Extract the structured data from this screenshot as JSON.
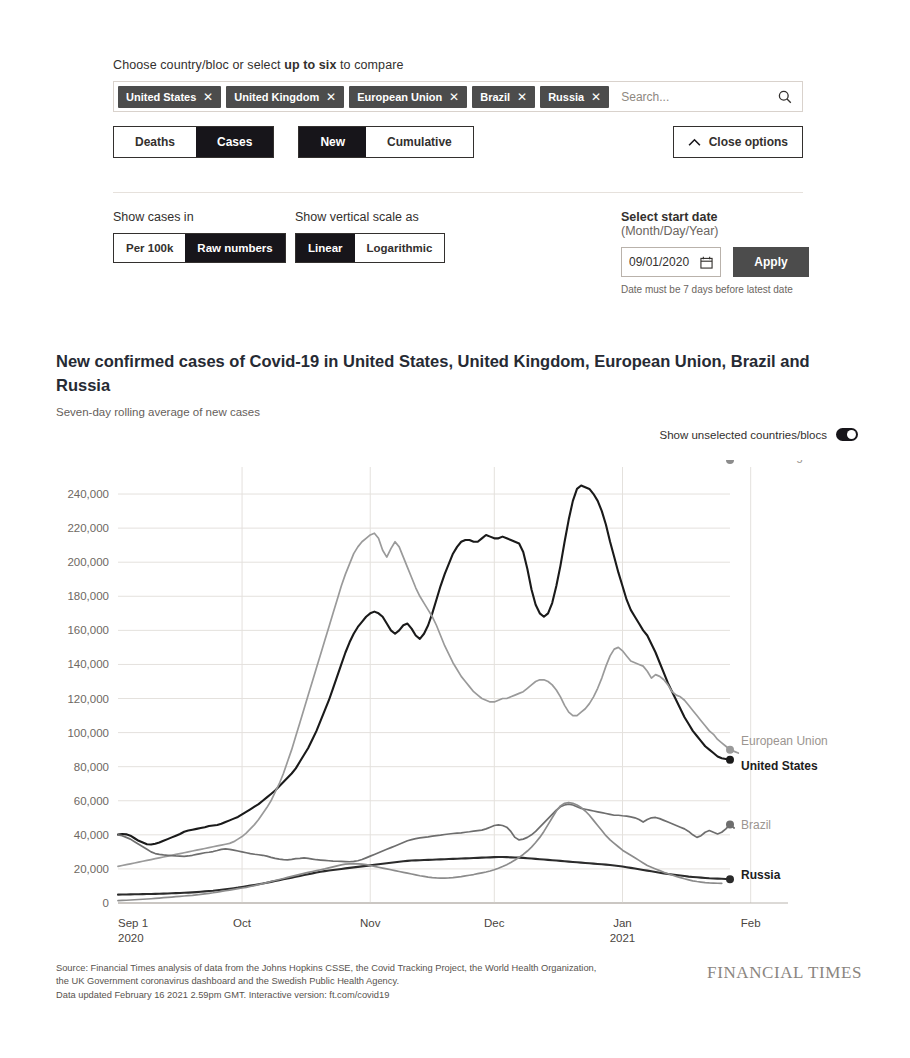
{
  "controls": {
    "choose_label_pre": "Choose country/bloc or select ",
    "choose_label_bold": "up to six",
    "choose_label_post": " to compare",
    "chips": [
      {
        "label": "United States",
        "remove": "✕"
      },
      {
        "label": "United Kingdom",
        "remove": "✕"
      },
      {
        "label": "European Union",
        "remove": "✕"
      },
      {
        "label": "Brazil",
        "remove": "✕"
      },
      {
        "label": "Russia",
        "remove": "✕"
      }
    ],
    "search": {
      "value": "",
      "placeholder": "Search...",
      "icon": "search-icon"
    },
    "metric_segment": {
      "options": [
        "Deaths",
        "Cases"
      ],
      "selected": "Cases"
    },
    "count_segment": {
      "options": [
        "New",
        "Cumulative"
      ],
      "selected": "New"
    },
    "close_options_label": "Close options",
    "show_cases_in": {
      "label": "Show cases in",
      "options": [
        "Per 100k",
        "Raw numbers"
      ],
      "selected": "Raw numbers"
    },
    "vertical_scale": {
      "label": "Show vertical scale as",
      "options": [
        "Linear",
        "Logarithmic"
      ],
      "selected": "Linear"
    },
    "start_date": {
      "label_strong": "Select start date",
      "label_muted": " (Month/Day/Year)",
      "value": "09/01/2020",
      "apply_label": "Apply",
      "hint": "Date must be 7 days before latest date"
    }
  },
  "chart_header": {
    "title": "New confirmed cases of Covid-19 in United States, United Kingdom, European Union, Brazil and Russia",
    "subtitle": "Seven-day rolling average of new cases",
    "toggle_label": "Show unselected countries/blocs",
    "toggle_on": true
  },
  "footer": {
    "line1": "Source: Financial Times analysis of data from the Johns Hopkins CSSE, the Covid Tracking Project, the World Health Organization,",
    "line2": "the UK Government coronavirus dashboard and the Swedish Public Health Agency.",
    "line3": "Data updated February 16 2021 2.59pm GMT. Interactive version: ft.com/covid19",
    "brand": "FINANCIAL TIMES"
  },
  "chart_data": {
    "type": "line",
    "title": "New confirmed cases of Covid-19 in United States, United Kingdom, European Union, Brazil and Russia",
    "subtitle": "Seven-day rolling average of new cases",
    "xlabel": "",
    "ylabel": "",
    "grid": true,
    "legend_position": "right-end-labels",
    "ylim": [
      0,
      250000
    ],
    "yticks": [
      0,
      20000,
      40000,
      60000,
      80000,
      100000,
      120000,
      140000,
      160000,
      180000,
      200000,
      220000,
      240000
    ],
    "ytick_labels": [
      "0",
      "20,000",
      "40,000",
      "60,000",
      "80,000",
      "100,000",
      "120,000",
      "140,000",
      "160,000",
      "180,000",
      "200,000",
      "220,000",
      "240,000"
    ],
    "xticks": [
      "Sep 1",
      "Oct",
      "Nov",
      "Dec",
      "Jan",
      "Feb"
    ],
    "xtick_sublabels": [
      "2020",
      "",
      "",
      "",
      "2021",
      ""
    ],
    "x_start": "2020-09-01",
    "x_end": "2021-02-16",
    "colors": {
      "United States": "#1a1a1a",
      "European Union": "#9a9a9a",
      "Brazil": "#6e6e6e",
      "Russia": "#2b2b2b",
      "United Kingdom": "#8c8c8c"
    },
    "series": [
      {
        "name": "United States",
        "color": "#1a1a1a",
        "end_value": 84000,
        "values": [
          40200,
          40500,
          40300,
          39500,
          38000,
          36500,
          35500,
          34500,
          34300,
          34800,
          35500,
          36500,
          37500,
          38500,
          39500,
          40500,
          41800,
          42500,
          43000,
          43500,
          44000,
          44500,
          45200,
          45500,
          45800,
          46500,
          47500,
          48500,
          49500,
          50500,
          52000,
          53500,
          55000,
          56500,
          58000,
          60000,
          62000,
          64000,
          66000,
          68500,
          71000,
          73500,
          76000,
          79000,
          83000,
          87000,
          91000,
          96000,
          101000,
          107000,
          113000,
          119000,
          126000,
          133000,
          140000,
          147000,
          153000,
          158000,
          162000,
          165000,
          168000,
          170000,
          171000,
          170000,
          168000,
          164000,
          160000,
          158000,
          160000,
          163000,
          164000,
          161000,
          157000,
          155000,
          158000,
          163000,
          170000,
          178000,
          186000,
          193000,
          199000,
          205000,
          209000,
          212000,
          213000,
          213000,
          212000,
          212000,
          214000,
          216000,
          215000,
          214000,
          214000,
          215000,
          214000,
          213000,
          212000,
          211000,
          206000,
          196000,
          184000,
          175000,
          170000,
          168000,
          170000,
          176000,
          186000,
          198000,
          212000,
          225000,
          236000,
          243000,
          245000,
          244000,
          243000,
          240000,
          236000,
          230000,
          222000,
          212000,
          203000,
          194000,
          186000,
          178000,
          172000,
          168000,
          164000,
          160000,
          157000,
          152000,
          147000,
          141000,
          135000,
          129000,
          124000,
          119000,
          114000,
          109000,
          105000,
          101000,
          98000,
          95000,
          92000,
          90000,
          88000,
          86000,
          85000,
          84500,
          84000
        ]
      },
      {
        "name": "European Union",
        "color": "#9a9a9a",
        "end_value": 88000,
        "values": [
          21500,
          22000,
          22500,
          23000,
          23500,
          24000,
          24500,
          25000,
          25500,
          26000,
          26500,
          27000,
          27500,
          28000,
          28500,
          29000,
          29500,
          30000,
          30500,
          31000,
          31500,
          32000,
          32500,
          33000,
          33500,
          34000,
          34500,
          35000,
          36000,
          37500,
          39000,
          41000,
          43500,
          46000,
          49000,
          52500,
          56000,
          60000,
          65000,
          70000,
          76000,
          83000,
          90000,
          98000,
          106000,
          114000,
          122000,
          130000,
          138000,
          146000,
          154000,
          162000,
          170000,
          178000,
          186000,
          193000,
          199000,
          205000,
          209000,
          212000,
          214000,
          216000,
          217000,
          214000,
          207000,
          203000,
          208000,
          212000,
          209000,
          203000,
          197000,
          191000,
          185000,
          180000,
          176000,
          172000,
          168000,
          163000,
          157000,
          151000,
          146000,
          141000,
          137000,
          133000,
          130000,
          127000,
          124000,
          122000,
          120000,
          119000,
          118000,
          118000,
          119000,
          120000,
          120000,
          121000,
          122000,
          123000,
          124000,
          126000,
          128000,
          130000,
          131000,
          131000,
          130000,
          128000,
          125000,
          121000,
          116000,
          112000,
          110000,
          110000,
          112000,
          114000,
          117000,
          121000,
          126000,
          132000,
          139000,
          145000,
          149000,
          150000,
          148000,
          145000,
          142000,
          141000,
          140000,
          139000,
          136000,
          132000,
          134000,
          133000,
          131000,
          128000,
          124000,
          122000,
          121000,
          119000,
          116000,
          113000,
          110000,
          107000,
          104000,
          101000,
          99000,
          96000,
          94000,
          92000,
          90000,
          89000,
          88000
        ]
      },
      {
        "name": "Brazil",
        "color": "#6e6e6e",
        "end_value": 44000,
        "values": [
          40000,
          39500,
          38500,
          37500,
          36000,
          34500,
          33000,
          31500,
          30000,
          29000,
          28500,
          28200,
          28000,
          27800,
          27600,
          27500,
          27400,
          27600,
          28000,
          28500,
          29000,
          29500,
          29800,
          30200,
          30800,
          31500,
          31800,
          31500,
          31000,
          30500,
          30000,
          29500,
          29000,
          28600,
          28300,
          28000,
          27500,
          26800,
          26200,
          25800,
          25500,
          25300,
          25600,
          26000,
          26200,
          26500,
          26200,
          25800,
          25400,
          25200,
          25000,
          24800,
          24600,
          24500,
          24400,
          24300,
          24200,
          24400,
          24800,
          25500,
          26500,
          27500,
          28500,
          29500,
          30500,
          31500,
          32500,
          33500,
          34500,
          35500,
          36500,
          37200,
          37800,
          38200,
          38500,
          38800,
          39200,
          39500,
          39800,
          40200,
          40500,
          40800,
          41000,
          41200,
          41500,
          41800,
          42200,
          42500,
          42800,
          43500,
          44500,
          45500,
          45800,
          45500,
          44500,
          42000,
          38500,
          37000,
          37500,
          38500,
          40000,
          42000,
          44500,
          47000,
          49500,
          52000,
          54500,
          56500,
          57500,
          58000,
          57500,
          56500,
          55500,
          55000,
          54500,
          54000,
          53500,
          53000,
          52500,
          52000,
          51500,
          51500,
          51200,
          51000,
          50500,
          50000,
          49000,
          47500,
          49000,
          50000,
          50200,
          49500,
          48500,
          47500,
          46500,
          45500,
          44500,
          43500,
          42000,
          40000,
          38500,
          39500,
          41500,
          42500,
          41500,
          40500,
          41500,
          43500,
          46000,
          44000
        ]
      },
      {
        "name": "Russia",
        "color": "#2b2b2b",
        "end_value": 14000,
        "values": [
          4900,
          4950,
          5000,
          5050,
          5100,
          5150,
          5200,
          5250,
          5300,
          5350,
          5400,
          5500,
          5600,
          5700,
          5800,
          5900,
          6000,
          6100,
          6250,
          6400,
          6600,
          6800,
          7000,
          7200,
          7500,
          7800,
          8100,
          8400,
          8700,
          9000,
          9400,
          9800,
          10200,
          10600,
          11000,
          11400,
          11900,
          12400,
          12900,
          13400,
          13900,
          14400,
          14900,
          15400,
          15900,
          16400,
          16900,
          17400,
          17900,
          18300,
          18700,
          19100,
          19400,
          19700,
          20000,
          20300,
          20600,
          20900,
          21200,
          21500,
          21800,
          22100,
          22400,
          22700,
          23000,
          23300,
          23600,
          23900,
          24200,
          24500,
          24700,
          24900,
          25000,
          25100,
          25200,
          25300,
          25400,
          25500,
          25600,
          25700,
          25800,
          25900,
          26000,
          26100,
          26200,
          26300,
          26400,
          26500,
          26600,
          26700,
          26800,
          26900,
          27000,
          27000,
          26900,
          26800,
          26700,
          26600,
          26500,
          26300,
          26100,
          25900,
          25700,
          25500,
          25300,
          25100,
          24900,
          24700,
          24500,
          24300,
          24100,
          23900,
          23700,
          23500,
          23300,
          23100,
          22900,
          22700,
          22500,
          22300,
          22000,
          21700,
          21400,
          21000,
          20600,
          20200,
          19800,
          19400,
          19000,
          18600,
          18200,
          17800,
          17400,
          17000,
          16700,
          16400,
          16100,
          15800,
          15500,
          15300,
          15100,
          14900,
          14700,
          14500,
          14400,
          14300,
          14200,
          14100,
          14000
        ]
      },
      {
        "name": "United Kingdom",
        "color": "#8c8c8c",
        "end_value": 11500,
        "values": [
          1400,
          1500,
          1600,
          1750,
          1900,
          2050,
          2200,
          2350,
          2500,
          2700,
          2900,
          3100,
          3300,
          3500,
          3700,
          3900,
          4100,
          4300,
          4500,
          4800,
          5100,
          5400,
          5700,
          6000,
          6400,
          6800,
          7200,
          7600,
          8000,
          8400,
          8800,
          9200,
          9700,
          10200,
          10800,
          11400,
          12000,
          12600,
          13200,
          13800,
          14400,
          15000,
          15600,
          16200,
          16800,
          17400,
          18000,
          18500,
          19000,
          19500,
          20000,
          20600,
          21200,
          21800,
          22400,
          22800,
          23000,
          23100,
          23000,
          22800,
          22500,
          22000,
          21500,
          21000,
          20500,
          20000,
          19500,
          19000,
          18500,
          18000,
          17500,
          17000,
          16500,
          16000,
          15600,
          15200,
          14900,
          14700,
          14600,
          14600,
          14700,
          14900,
          15200,
          15500,
          15900,
          16300,
          16700,
          17200,
          17700,
          18200,
          18800,
          19500,
          20400,
          21400,
          22500,
          23800,
          25200,
          26800,
          28500,
          30500,
          32800,
          35500,
          38500,
          42000,
          46000,
          50000,
          54000,
          57000,
          58500,
          59000,
          58500,
          57500,
          56000,
          54000,
          51500,
          48500,
          45500,
          42500,
          39500,
          37000,
          35000,
          33000,
          31000,
          29500,
          28000,
          26500,
          25000,
          23500,
          22000,
          21000,
          20000,
          19000,
          18000,
          17200,
          16400,
          15600,
          14900,
          14200,
          13600,
          13000,
          12600,
          12300,
          12000,
          11800,
          11700,
          11600,
          11500
        ]
      }
    ],
    "end_labels": [
      {
        "name": "European Union",
        "bold": false,
        "value": 88000
      },
      {
        "name": "United States",
        "bold": true,
        "value": 84000
      },
      {
        "name": "Brazil",
        "bold": false,
        "value": 44000
      },
      {
        "name": "Russia",
        "bold": true,
        "value": 14000
      },
      {
        "name": "United Kingdom",
        "bold": false,
        "value": 11500
      }
    ]
  }
}
